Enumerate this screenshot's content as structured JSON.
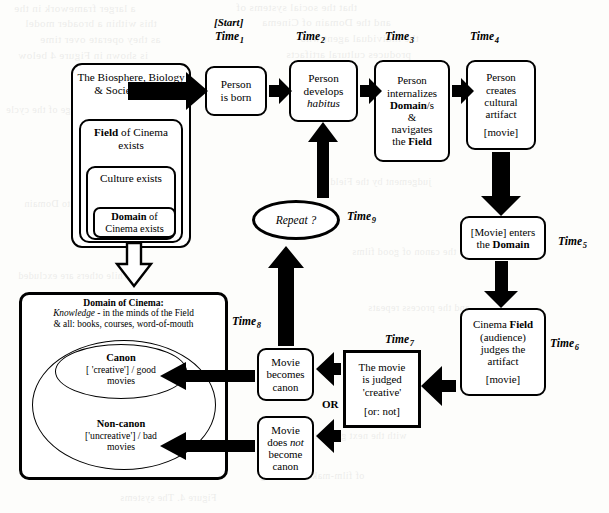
{
  "ghost_text": [
    {
      "t": "a larger framework in the",
      "x": 14,
      "y": 2,
      "s": 11
    },
    {
      "t": "that the social systems of",
      "x": 236,
      "y": 1,
      "s": 11
    },
    {
      "t": "this within a broader model",
      "x": 25,
      "y": 17,
      "s": 11
    },
    {
      "t": "and the Domain of Cinema",
      "x": 262,
      "y": 16,
      "s": 11
    },
    {
      "t": "as they operate over time",
      "x": 40,
      "y": 33,
      "s": 11
    },
    {
      "t": "the individual agent who",
      "x": 300,
      "y": 32,
      "s": 11
    },
    {
      "t": "is shown in Figure 4 below",
      "x": 18,
      "y": 49,
      "s": 11
    },
    {
      "t": "produces cultural artifacts",
      "x": 286,
      "y": 48,
      "s": 11
    },
    {
      "t": "each stage of the cycle",
      "x": 6,
      "y": 104,
      "s": 10
    },
    {
      "t": "judgement by the Field",
      "x": 330,
      "y": 176,
      "s": 10
    },
    {
      "t": "feeds back into Domain",
      "x": 24,
      "y": 198,
      "s": 10
    },
    {
      "t": "the canon of good films",
      "x": 352,
      "y": 246,
      "s": 10
    },
    {
      "t": "while others are excluded",
      "x": 18,
      "y": 270,
      "s": 10
    },
    {
      "t": "and the process repeats",
      "x": 368,
      "y": 302,
      "s": 10
    },
    {
      "t": "with the next generation",
      "x": 300,
      "y": 430,
      "s": 10
    },
    {
      "t": "of film-makers working",
      "x": 260,
      "y": 470,
      "s": 10
    },
    {
      "t": "Figure 4. The systems",
      "x": 120,
      "y": 492,
      "s": 10
    }
  ],
  "time_labels": [
    {
      "name": "time-1",
      "base": "Time",
      "sub": "1",
      "x": 215,
      "y": 30
    },
    {
      "name": "time-2",
      "base": "Time",
      "sub": "2",
      "x": 296,
      "y": 30
    },
    {
      "name": "time-3",
      "base": "Time",
      "sub": "3",
      "x": 385,
      "y": 30
    },
    {
      "name": "time-4",
      "base": "Time",
      "sub": "4",
      "x": 470,
      "y": 30
    },
    {
      "name": "time-5",
      "base": "Time",
      "sub": "5",
      "x": 558,
      "y": 235
    },
    {
      "name": "time-6",
      "base": "Time",
      "sub": "6",
      "x": 550,
      "y": 337
    },
    {
      "name": "time-7",
      "base": "Time",
      "sub": "7",
      "x": 385,
      "y": 333
    },
    {
      "name": "time-8",
      "base": "Time",
      "sub": "8",
      "x": 232,
      "y": 315
    },
    {
      "name": "time-9",
      "base": "Time",
      "sub": "9",
      "x": 347,
      "y": 210
    }
  ],
  "start_label": "[Start]",
  "or_label": "OR",
  "nesting": {
    "outer_label_lines": [
      "The Biosphere,",
      "Biology &",
      "Society exists"
    ],
    "field_lines_a": "Field",
    "field_lines_b": " of",
    "field_line2": "Cinema exists",
    "culture_line1": "Culture",
    "culture_line2": "exists",
    "domain_a": "Domain",
    "domain_b": " of",
    "domain_line2": "Cinema exists"
  },
  "nodes": {
    "born": {
      "lines": [
        "Person",
        "is born"
      ]
    },
    "habitus": {
      "l1": "Person",
      "l2": "develops",
      "l3": "habitus"
    },
    "internalize": {
      "l1": "Person",
      "l2": "internalizes",
      "l3a": "Domain",
      "l3b": "/s",
      "l4": "&",
      "l5": "navigates",
      "l6a": "the ",
      "l6b": "Field"
    },
    "creates": {
      "l1": "Person",
      "l2": "creates",
      "l3": "cultural",
      "l4": "artifact",
      "l5": "[movie]"
    },
    "enters": {
      "l1a": "[Movie] enters",
      "l2a": "the ",
      "l2b": "Domain"
    },
    "judges": {
      "l1a": "Cinema ",
      "l1b": "Field",
      "l2": "(audience)",
      "l3": "judges the",
      "l4": "artifact",
      "l5": "[movie]"
    },
    "judged": {
      "l1": "The movie",
      "l2": "is judged",
      "l3": "'creative'",
      "l4": "[or: not]"
    },
    "canonyes": {
      "l1": "Movie",
      "l2": "becomes",
      "l3": "canon"
    },
    "canonno": {
      "l1": "Movie",
      "l2a": "does ",
      "l2b": "not",
      "l3": "become",
      "l4": "canon"
    },
    "repeat": {
      "label": "Repeat ?"
    }
  },
  "domain_box": {
    "title": "Domain of Cinema:",
    "sub1a": "Knowledge",
    "sub1b": " - in the minds of the Field",
    "sub2": "& all: books, courses, word-of-mouth",
    "canon_title": "Canon",
    "canon_l1": "[ 'creative'] / good",
    "canon_l2": "movies",
    "noncanon_title": "Non-canon",
    "noncanon_l1": "['uncreative'] / bad",
    "noncanon_l2": "movies"
  },
  "colors": {
    "ink": "#000000",
    "paper": "#fdfdfb",
    "arrow": "#000000"
  }
}
